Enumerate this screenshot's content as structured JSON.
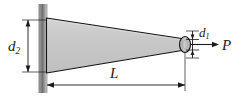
{
  "figure": {
    "name": "tapered-bar-axial-load-diagram",
    "width": 242,
    "height": 100,
    "background": "#ffffff"
  },
  "labels": {
    "d2": {
      "base": "d",
      "sub": "2"
    },
    "d1": {
      "base": "d",
      "sub": "1"
    },
    "P": "P",
    "L": "L"
  },
  "colors": {
    "bar_fill": "#c8c8c8",
    "bar_fill_light": "#d6d6d6",
    "outline": "#111111",
    "wall_dark": "#6e6e6e",
    "wall_mid": "#9b9b9b",
    "wall_light": "#cfcfcf",
    "dimension_line": "#1a1a1a",
    "end_cap_fill": "#bdbdbd"
  },
  "geometry": {
    "wall": {
      "x": 39,
      "y": 4,
      "width": 8,
      "height": 89
    },
    "bar": {
      "left_x": 46,
      "left_top_y": 18,
      "left_bottom_y": 73,
      "right_x": 185,
      "right_top_y": 39,
      "right_bottom_y": 50
    },
    "end_cap_ellipse": {
      "cx": 185,
      "cy": 44.5,
      "rx": 5.5,
      "ry": 8
    },
    "dimension_d2": {
      "x": 28,
      "y_top": 20,
      "y_bottom": 72
    },
    "dimension_d1": {
      "x": 192,
      "y_top": 30,
      "y_bottom": 59
    },
    "dimension_L": {
      "y": 85,
      "x_left": 47,
      "x_right": 185
    },
    "force_arrow_P": {
      "x_start": 190,
      "x_end": 218,
      "y": 44.5
    }
  }
}
